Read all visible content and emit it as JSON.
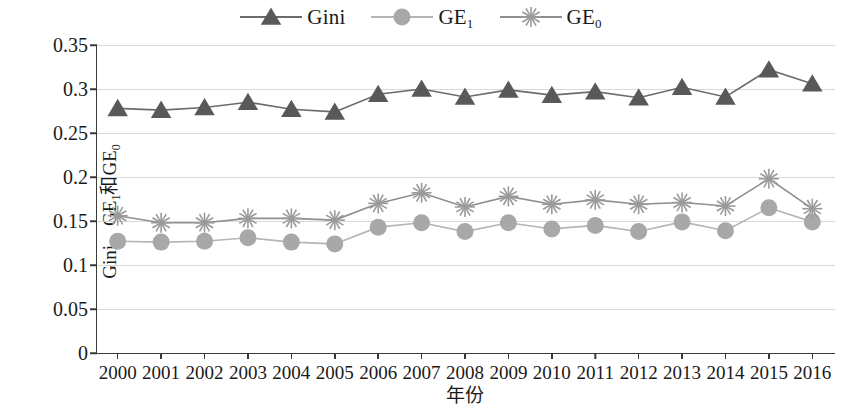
{
  "chart_data": {
    "type": "line",
    "title": "",
    "xlabel": "年份",
    "ylabel": "Gini、GE₁和GE₀",
    "ylabel_parts": {
      "a": "Gini、GE",
      "sub1": "1",
      "b": "和GE",
      "sub2": "0"
    },
    "categories": [
      "2000",
      "2001",
      "2002",
      "2003",
      "2004",
      "2005",
      "2006",
      "2007",
      "2008",
      "2009",
      "2010",
      "2011",
      "2012",
      "2013",
      "2014",
      "2015",
      "2016"
    ],
    "ylim": [
      0,
      0.35
    ],
    "yticks": [
      "0",
      "0.05",
      "0.1",
      "0.15",
      "0.2",
      "0.25",
      "0.3",
      "0.35"
    ],
    "ytick_values": [
      0,
      0.05,
      0.1,
      0.15,
      0.2,
      0.25,
      0.3,
      0.35
    ],
    "grid": true,
    "legend_position": "top-center",
    "series": [
      {
        "name": "Gini",
        "label_base": "Gini",
        "label_sub": "",
        "marker": "triangle",
        "color": "#595959",
        "line_color": "#6b6b6b",
        "values": [
          0.278,
          0.276,
          0.279,
          0.285,
          0.277,
          0.274,
          0.294,
          0.3,
          0.291,
          0.299,
          0.293,
          0.297,
          0.29,
          0.302,
          0.291,
          0.322,
          0.306
        ]
      },
      {
        "name": "GE1",
        "label_base": "GE",
        "label_sub": "1",
        "marker": "circle",
        "color": "#a8a8a8",
        "line_color": "#b5b5b5",
        "values": [
          0.127,
          0.126,
          0.127,
          0.131,
          0.126,
          0.124,
          0.143,
          0.148,
          0.138,
          0.148,
          0.141,
          0.145,
          0.138,
          0.149,
          0.139,
          0.165,
          0.149
        ]
      },
      {
        "name": "GE0",
        "label_base": "GE",
        "label_sub": "0",
        "marker": "asterisk",
        "color": "#9a9a9a",
        "line_color": "#8f8f8f",
        "values": [
          0.156,
          0.148,
          0.148,
          0.153,
          0.153,
          0.151,
          0.17,
          0.182,
          0.166,
          0.178,
          0.169,
          0.174,
          0.169,
          0.171,
          0.167,
          0.198,
          0.164
        ]
      }
    ]
  },
  "colors": {
    "axis": "#3a3a3a",
    "grid": "#d9d9d9",
    "background": "#ffffff"
  }
}
